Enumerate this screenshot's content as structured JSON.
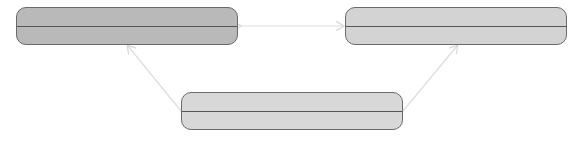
{
  "diagram": {
    "nodes": [
      {
        "id": "node-left",
        "label": "",
        "x": 16,
        "y": 7,
        "w": 222,
        "h": 38,
        "fill": "#b9b9b9",
        "divider_y": 19
      },
      {
        "id": "node-right",
        "label": "",
        "x": 345,
        "y": 7,
        "w": 222,
        "h": 38,
        "fill": "#d3d3d3",
        "divider_y": 19
      },
      {
        "id": "node-bottom",
        "label": "",
        "x": 181,
        "y": 92,
        "w": 222,
        "h": 38,
        "fill": "#d8d8d8",
        "divider_y": 19
      }
    ],
    "edges": [
      {
        "from": "node-left",
        "to": "node-right",
        "type": "bidirectional",
        "color": "#dddddd"
      },
      {
        "from": "node-bottom",
        "to": "node-left",
        "type": "arrow",
        "color": "#dddddd"
      },
      {
        "from": "node-bottom",
        "to": "node-right",
        "type": "arrow",
        "color": "#dddddd"
      }
    ],
    "colors": {
      "border": "#6a6a6a",
      "divider": "#555555",
      "edge": "#dddddd"
    }
  }
}
